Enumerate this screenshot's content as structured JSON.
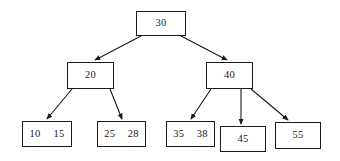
{
  "diagram": {
    "type": "b-tree",
    "background_color": "#ffffff",
    "line_color": "#1a1a1a",
    "node_fill": "#ffffff",
    "nodes": [
      {
        "id": "root",
        "keys": [
          "30"
        ],
        "x": 136,
        "y": 11,
        "w": 50,
        "h": 25,
        "level": 0
      },
      {
        "id": "internal-left",
        "keys": [
          "20"
        ],
        "x": 67,
        "y": 62,
        "w": 47,
        "h": 27,
        "level": 1
      },
      {
        "id": "internal-right",
        "keys": [
          "40"
        ],
        "x": 206,
        "y": 62,
        "w": 47,
        "h": 27,
        "level": 1
      },
      {
        "id": "leaf-1",
        "keys": [
          "10",
          "15"
        ],
        "x": 22,
        "y": 121,
        "w": 50,
        "h": 26,
        "level": 2
      },
      {
        "id": "leaf-2",
        "keys": [
          "25",
          "28"
        ],
        "x": 97,
        "y": 121,
        "w": 49,
        "h": 26,
        "level": 2
      },
      {
        "id": "leaf-3",
        "keys": [
          "35",
          "38"
        ],
        "x": 166,
        "y": 121,
        "w": 49,
        "h": 26,
        "level": 2
      },
      {
        "id": "leaf-4",
        "keys": [
          "45"
        ],
        "x": 220,
        "y": 126,
        "w": 46,
        "h": 26,
        "level": 2
      },
      {
        "id": "leaf-5",
        "keys": [
          "55"
        ],
        "x": 275,
        "y": 122,
        "w": 46,
        "h": 27,
        "level": 2
      }
    ],
    "edges": [
      {
        "id": "edge-root-left",
        "from": "root",
        "to": "internal-left",
        "x1": 141,
        "y1": 36,
        "x2": 95,
        "y2": 60
      },
      {
        "id": "edge-root-right",
        "from": "root",
        "to": "internal-right",
        "x1": 181,
        "y1": 36,
        "x2": 227,
        "y2": 60
      },
      {
        "id": "edge-left-leaf1",
        "from": "internal-left",
        "to": "leaf-1",
        "x1": 72,
        "y1": 89,
        "x2": 47,
        "y2": 119
      },
      {
        "id": "edge-left-leaf2",
        "from": "internal-left",
        "to": "leaf-2",
        "x1": 110,
        "y1": 89,
        "x2": 122,
        "y2": 119
      },
      {
        "id": "edge-right-leaf3",
        "from": "internal-right",
        "to": "leaf-3",
        "x1": 211,
        "y1": 89,
        "x2": 191,
        "y2": 119
      },
      {
        "id": "edge-right-leaf4",
        "from": "internal-right",
        "to": "leaf-4",
        "x1": 241,
        "y1": 89,
        "x2": 241,
        "y2": 124
      },
      {
        "id": "edge-right-leaf5",
        "from": "internal-right",
        "to": "leaf-5",
        "x1": 251,
        "y1": 89,
        "x2": 288,
        "y2": 120
      }
    ]
  }
}
